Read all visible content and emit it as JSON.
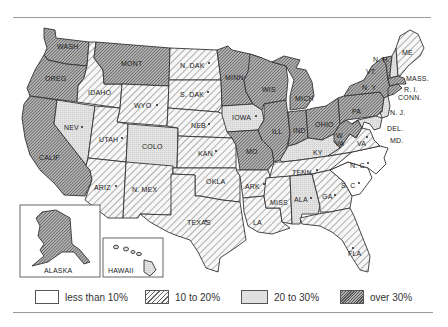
{
  "map": {
    "title": "",
    "categories": {
      "lt10": {
        "label": "less than 10%",
        "pattern": "white"
      },
      "10to20": {
        "label": "10 to 20%",
        "pattern": "diagonal-hatch"
      },
      "20to30": {
        "label": "20 to 30%",
        "pattern": "light-stipple"
      },
      "over30": {
        "label": "over 30%",
        "pattern": "dense-hatch"
      }
    },
    "states": [
      {
        "name": "WASH",
        "category": "over30",
        "star": false
      },
      {
        "name": "OREG",
        "category": "over30",
        "star": false
      },
      {
        "name": "CALIF",
        "category": "over30",
        "star": false
      },
      {
        "name": "IDAHO",
        "category": "10to20",
        "star": false
      },
      {
        "name": "NEV",
        "category": "20to30",
        "star": true
      },
      {
        "name": "MONT",
        "category": "over30",
        "star": false
      },
      {
        "name": "WYO",
        "category": "10to20",
        "star": true
      },
      {
        "name": "UTAH",
        "category": "10to20",
        "star": true
      },
      {
        "name": "COLO",
        "category": "20to30",
        "star": false
      },
      {
        "name": "ARIZ",
        "category": "10to20",
        "star": true
      },
      {
        "name": "N. MEX",
        "category": "10to20",
        "star": false
      },
      {
        "name": "N. DAK",
        "category": "10to20",
        "star": true
      },
      {
        "name": "S. DAK",
        "category": "10to20",
        "star": true
      },
      {
        "name": "NEB",
        "category": "10to20",
        "star": true
      },
      {
        "name": "KAN",
        "category": "10to20",
        "star": true
      },
      {
        "name": "OKLA",
        "category": "10to20",
        "star": false
      },
      {
        "name": "TEXAS",
        "category": "10to20",
        "star": true
      },
      {
        "name": "MINN",
        "category": "over30",
        "star": false
      },
      {
        "name": "IOWA",
        "category": "20to30",
        "star": true
      },
      {
        "name": "MO",
        "category": "over30",
        "star": false
      },
      {
        "name": "ARK",
        "category": "10to20",
        "star": true
      },
      {
        "name": "LA",
        "category": "10to20",
        "star": false
      },
      {
        "name": "WIS",
        "category": "over30",
        "star": false
      },
      {
        "name": "ILL",
        "category": "over30",
        "star": false
      },
      {
        "name": "MICH",
        "category": "over30",
        "star": false
      },
      {
        "name": "IND",
        "category": "over30",
        "star": false
      },
      {
        "name": "OHIO",
        "category": "over30",
        "star": false
      },
      {
        "name": "KY",
        "category": "20to30",
        "star": false
      },
      {
        "name": "TENN",
        "category": "10to20",
        "star": true
      },
      {
        "name": "MISS",
        "category": "10to20",
        "star": false
      },
      {
        "name": "ALA",
        "category": "20to30",
        "star": true
      },
      {
        "name": "GA",
        "category": "10to20",
        "star": true
      },
      {
        "name": "FLA",
        "category": "10to20",
        "star": true
      },
      {
        "name": "S. C",
        "category": "lt10",
        "star": true
      },
      {
        "name": "N. C",
        "category": "lt10",
        "star": true
      },
      {
        "name": "VA",
        "category": "10to20",
        "star": true
      },
      {
        "name": "W. VA",
        "category": "over30",
        "star": false
      },
      {
        "name": "PA",
        "category": "over30",
        "star": false
      },
      {
        "name": "N. Y",
        "category": "over30",
        "star": false
      },
      {
        "name": "VT",
        "category": "over30",
        "star": false
      },
      {
        "name": "N. H",
        "category": "20to30",
        "star": false
      },
      {
        "name": "ME",
        "category": "10to20",
        "star": false
      },
      {
        "name": "MASS",
        "category": "over30",
        "star": false
      },
      {
        "name": "R. I",
        "category": "over30",
        "star": false
      },
      {
        "name": "CONN",
        "category": "over30",
        "star": false
      },
      {
        "name": "N. J",
        "category": "20to30",
        "star": false
      },
      {
        "name": "DEL",
        "category": "20to30",
        "star": false
      },
      {
        "name": "MD",
        "category": "20to30",
        "star": false
      },
      {
        "name": "ALASKA",
        "category": "over30",
        "star": false
      },
      {
        "name": "HAWAII",
        "category": "20to30",
        "star": false
      }
    ],
    "labels": {
      "wash": "WASH",
      "oreg": "OREG",
      "calif": "CALIF",
      "idaho": "IDAHO",
      "nev": "NEV",
      "mont": "MONT",
      "wyo": "WYO",
      "utah": "UTAH",
      "colo": "COLO",
      "ariz": "ARIZ",
      "nmex": "N. MEX",
      "ndak": "N. DAK",
      "sdak": "S. DAK",
      "neb": "NEB",
      "kan": "KAN",
      "okla": "OKLA",
      "texas": "TEXAS",
      "minn": "MINN",
      "iowa": "IOWA",
      "mo": "MO",
      "ark": "ARK",
      "la": "LA",
      "wis": "WIS",
      "ill": "ILL",
      "mich": "MICH",
      "ind": "IND",
      "ohio": "OHIO",
      "ky": "KY",
      "tenn": "TENN",
      "miss": "MISS",
      "ala": "ALA",
      "ga": "GA",
      "fla": "FLA",
      "sc": "S. C",
      "nc": "N. C",
      "va": "VA",
      "wva1": "W",
      "wva2": "VA",
      "pa": "PA",
      "ny": "N. Y",
      "vt": "VT.",
      "nh": "N. H.",
      "me": "ME",
      "mass": "MASS.",
      "ri": "R. I.",
      "conn": "CONN.",
      "nj": "N. J.",
      "del": "DEL.",
      "md": "MD.",
      "alaska": "ALASKA",
      "hawaii": "HAWAII"
    },
    "star_marker": "*"
  },
  "legend": {
    "items": [
      {
        "label": "less than 10%"
      },
      {
        "label": "10 to 20%"
      },
      {
        "label": "20 to 30%"
      },
      {
        "label": "over 30%"
      }
    ]
  }
}
